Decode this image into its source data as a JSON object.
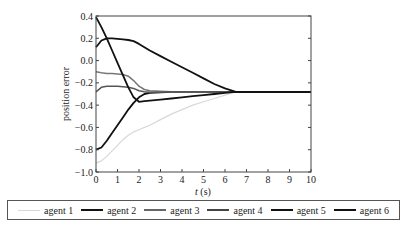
{
  "chart_data": {
    "type": "line",
    "title": "",
    "xlabel": "t(s)",
    "ylabel": "position error",
    "xlim": [
      0,
      10
    ],
    "ylim": [
      -1.0,
      0.4
    ],
    "xticks": [
      "0",
      "1",
      "2",
      "3",
      "4",
      "5",
      "6",
      "7",
      "8",
      "9",
      "10"
    ],
    "yticks": [
      "0.4",
      "0.2",
      "0.0",
      "-0.2",
      "-0.4",
      "-0.6",
      "-0.8",
      "-1.0"
    ],
    "grid": false,
    "legend_position": "bottom",
    "x": [
      0,
      0.25,
      0.5,
      0.75,
      1.0,
      1.25,
      1.5,
      1.75,
      2.0,
      2.25,
      2.5,
      3.0,
      3.5,
      4.0,
      4.5,
      5.0,
      5.5,
      6.0,
      6.5,
      7.0,
      8.0,
      9.0,
      10.0
    ],
    "series": [
      {
        "name": "agent 1",
        "color": "#d8d8d8",
        "width": 1.2,
        "values": [
          -0.92,
          -0.9,
          -0.86,
          -0.81,
          -0.76,
          -0.71,
          -0.67,
          -0.64,
          -0.62,
          -0.6,
          -0.58,
          -0.53,
          -0.48,
          -0.44,
          -0.4,
          -0.37,
          -0.34,
          -0.31,
          -0.28,
          -0.28,
          -0.28,
          -0.28,
          -0.28
        ]
      },
      {
        "name": "agent 2",
        "color": "#111111",
        "width": 1.8,
        "values": [
          -0.8,
          -0.78,
          -0.72,
          -0.65,
          -0.58,
          -0.51,
          -0.44,
          -0.38,
          -0.33,
          -0.3,
          -0.29,
          -0.285,
          -0.28,
          -0.28,
          -0.28,
          -0.28,
          -0.28,
          -0.28,
          -0.28,
          -0.28,
          -0.28,
          -0.28,
          -0.28
        ]
      },
      {
        "name": "agent 3",
        "color": "#777777",
        "width": 1.5,
        "values": [
          -0.1,
          -0.11,
          -0.115,
          -0.115,
          -0.12,
          -0.125,
          -0.14,
          -0.18,
          -0.23,
          -0.26,
          -0.27,
          -0.275,
          -0.28,
          -0.28,
          -0.28,
          -0.28,
          -0.28,
          -0.28,
          -0.28,
          -0.28,
          -0.28,
          -0.28,
          -0.28
        ]
      },
      {
        "name": "agent 4",
        "color": "#555555",
        "width": 1.5,
        "values": [
          -0.28,
          -0.24,
          -0.23,
          -0.23,
          -0.23,
          -0.235,
          -0.24,
          -0.25,
          -0.27,
          -0.28,
          -0.285,
          -0.285,
          -0.28,
          -0.28,
          -0.28,
          -0.28,
          -0.28,
          -0.28,
          -0.28,
          -0.28,
          -0.28,
          -0.28,
          -0.28
        ]
      },
      {
        "name": "agent 5",
        "color": "#111111",
        "width": 1.8,
        "values": [
          0.12,
          0.18,
          0.2,
          0.2,
          0.195,
          0.19,
          0.185,
          0.175,
          0.15,
          0.12,
          0.09,
          0.04,
          -0.01,
          -0.06,
          -0.11,
          -0.16,
          -0.21,
          -0.25,
          -0.28,
          -0.28,
          -0.28,
          -0.28,
          -0.28
        ]
      },
      {
        "name": "agent 6",
        "color": "#111111",
        "width": 1.8,
        "values": [
          0.39,
          0.3,
          0.2,
          0.09,
          -0.02,
          -0.13,
          -0.24,
          -0.33,
          -0.37,
          -0.365,
          -0.36,
          -0.35,
          -0.34,
          -0.33,
          -0.32,
          -0.31,
          -0.3,
          -0.29,
          -0.28,
          -0.28,
          -0.28,
          -0.28,
          -0.28
        ]
      }
    ]
  },
  "legend": [
    {
      "label": "agent 1",
      "color": "#d8d8d8",
      "width": 1
    },
    {
      "label": "agent 2",
      "color": "#111111",
      "width": 2
    },
    {
      "label": "agent 3",
      "color": "#666666",
      "width": 2
    },
    {
      "label": "agent 4",
      "color": "#444444",
      "width": 2
    },
    {
      "label": "agent 5",
      "color": "#111111",
      "width": 2
    },
    {
      "label": "agent 6",
      "color": "#111111",
      "width": 2
    }
  ]
}
